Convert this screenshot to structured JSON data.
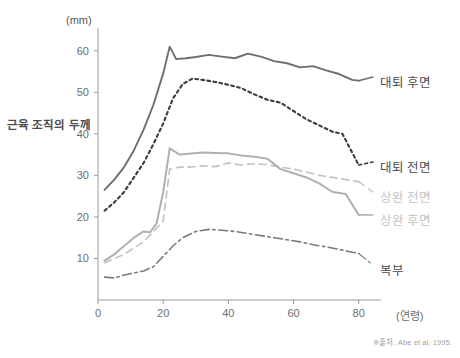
{
  "chart_data": {
    "type": "line",
    "title": "",
    "subtitle": "",
    "xlabel": "(연령)",
    "ylabel": "근육 조직의 두께",
    "yunit": "(mm)",
    "xlim": [
      0,
      85
    ],
    "ylim": [
      0,
      65
    ],
    "xticks": [
      0,
      20,
      40,
      60,
      80
    ],
    "yticks": [
      10,
      20,
      30,
      40,
      50,
      60
    ],
    "grid": false,
    "legend_position": "right-inline",
    "source_note": "※출처: Abe et al, 1995.",
    "series": [
      {
        "name": "대퇴 후면",
        "color": "#6e6e70",
        "style": "solid",
        "width": 1.9,
        "label_x": 380,
        "label_y": 81,
        "x": [
          2,
          5,
          8,
          11,
          14,
          17,
          20,
          22,
          24,
          27,
          30,
          34,
          38,
          42,
          46,
          50,
          54,
          58,
          62,
          66,
          70,
          74,
          78,
          80
        ],
        "y": [
          26.5,
          29.0,
          32.0,
          36.0,
          41.0,
          47.0,
          54.5,
          61.0,
          58.0,
          58.2,
          58.5,
          59.0,
          58.6,
          58.2,
          59.3,
          58.6,
          57.5,
          57.0,
          56.0,
          56.3,
          55.3,
          54.4,
          53.0,
          52.8
        ]
      },
      {
        "name": "대퇴 전면",
        "color": "#3c3c3e",
        "style": "dotted",
        "width": 2.1,
        "label_x": 380,
        "label_y": 166,
        "x": [
          2,
          5,
          8,
          11,
          14,
          17,
          20,
          23,
          26,
          29,
          32,
          36,
          40,
          44,
          48,
          52,
          56,
          60,
          64,
          68,
          72,
          75,
          78,
          80
        ],
        "y": [
          21.5,
          23.5,
          26.0,
          29.5,
          33.0,
          37.5,
          42.5,
          48.5,
          52.0,
          53.3,
          53.0,
          52.5,
          51.8,
          51.0,
          49.5,
          48.2,
          47.5,
          45.5,
          43.5,
          42.0,
          40.5,
          40.0,
          35.5,
          32.5
        ]
      },
      {
        "name": "상완 전면",
        "color": "#c4c4c4",
        "style": "dashed",
        "width": 1.7,
        "label_x": 380,
        "label_y": 196,
        "x": [
          2,
          5,
          8,
          11,
          14,
          17,
          20,
          22,
          25,
          28,
          32,
          36,
          40,
          44,
          48,
          52,
          56,
          60,
          64,
          68,
          72,
          76,
          80
        ],
        "y": [
          9.0,
          10.0,
          11.0,
          12.5,
          14.0,
          16.5,
          19.0,
          31.5,
          32.0,
          32.0,
          32.3,
          32.1,
          33.0,
          32.5,
          32.8,
          32.6,
          32.0,
          31.5,
          30.8,
          30.0,
          29.5,
          29.0,
          28.5
        ]
      },
      {
        "name": "상완 후면",
        "color": "#b0b0b0",
        "style": "solid",
        "width": 2.0,
        "label_x": 380,
        "label_y": 219,
        "x": [
          2,
          5,
          8,
          11,
          14,
          16,
          18,
          20,
          22,
          25,
          28,
          32,
          36,
          40,
          44,
          48,
          52,
          56,
          60,
          64,
          68,
          72,
          76,
          80
        ],
        "y": [
          9.5,
          11.0,
          13.0,
          15.0,
          16.5,
          16.3,
          18.5,
          26.0,
          36.5,
          35.0,
          35.2,
          35.5,
          35.4,
          35.3,
          34.8,
          34.5,
          34.0,
          31.5,
          30.5,
          29.5,
          28.0,
          26.0,
          25.5,
          20.5
        ]
      },
      {
        "name": "복부",
        "color": "#7a7a7c",
        "style": "dashdot",
        "width": 1.6,
        "label_x": 380,
        "label_y": 269,
        "x": [
          2,
          5,
          8,
          11,
          14,
          17,
          20,
          23,
          26,
          30,
          34,
          38,
          42,
          46,
          50,
          54,
          58,
          62,
          66,
          70,
          74,
          78,
          80
        ],
        "y": [
          5.5,
          5.3,
          6.0,
          6.5,
          7.0,
          8.0,
          10.5,
          13.0,
          15.0,
          16.5,
          17.0,
          16.8,
          16.5,
          16.0,
          15.5,
          15.0,
          14.5,
          14.0,
          13.3,
          12.8,
          12.2,
          11.5,
          11.2
        ]
      }
    ]
  },
  "axes": {
    "unit_label": "(mm)",
    "y_title": "근육 조직의 두께",
    "x_title": "(연령)",
    "xtick_labels": [
      "0",
      "20",
      "40",
      "60",
      "80"
    ],
    "ytick_labels": [
      "10",
      "20",
      "30",
      "40",
      "50",
      "60"
    ]
  },
  "footer": {
    "source": "※출처: Abe et al, 1995."
  }
}
